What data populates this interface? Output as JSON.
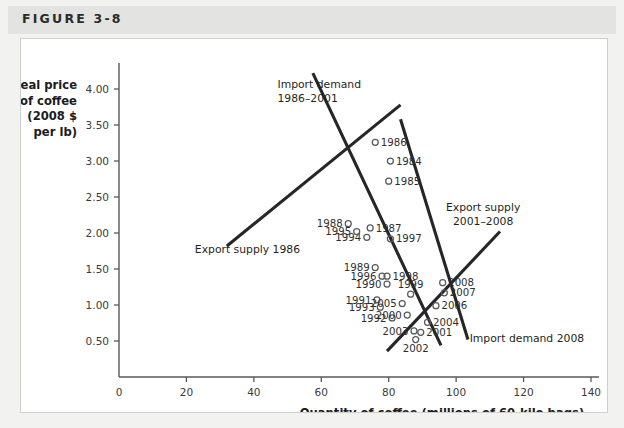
{
  "figure": {
    "label": "FIGURE 3-8"
  },
  "chart_data": {
    "type": "scatter",
    "title": "",
    "xlabel": "Quantity of coffee (millions of 60-kilo bags)",
    "ylabel_lines": [
      "Real price",
      "of coffee",
      "(2008 $",
      "per lb)"
    ],
    "xlim": [
      0,
      140
    ],
    "ylim": [
      0,
      4.25
    ],
    "xticks": [
      0,
      20,
      40,
      60,
      80,
      100,
      120,
      140
    ],
    "xtick_labels": [
      "0",
      "20",
      "40",
      "60",
      "80",
      "100",
      "120",
      "140"
    ],
    "yticks": [
      0.5,
      1.0,
      1.5,
      2.0,
      2.5,
      3.0,
      3.5,
      4.0
    ],
    "ytick_labels": [
      "0.50",
      "1.00",
      "1.50",
      "2.00",
      "2.50",
      "3.00",
      "3.50",
      "4.00"
    ],
    "grid": false,
    "legend": "none",
    "points": [
      {
        "year": "1984",
        "x": 80.5,
        "y": 3.0,
        "label_side": "right"
      },
      {
        "year": "1985",
        "x": 80.0,
        "y": 2.72,
        "label_side": "right"
      },
      {
        "year": "1986",
        "x": 76.0,
        "y": 3.26,
        "label_side": "right"
      },
      {
        "year": "1987",
        "x": 74.5,
        "y": 2.07,
        "label_side": "right"
      },
      {
        "year": "1988",
        "x": 68.0,
        "y": 2.13,
        "label_side": "left"
      },
      {
        "year": "1989",
        "x": 76.0,
        "y": 1.52,
        "label_side": "left"
      },
      {
        "year": "1990",
        "x": 79.5,
        "y": 1.29,
        "label_side": "left"
      },
      {
        "year": "1991",
        "x": 76.5,
        "y": 1.07,
        "label_side": "left"
      },
      {
        "year": "1992",
        "x": 81.0,
        "y": 0.82,
        "label_side": "left"
      },
      {
        "year": "1993",
        "x": 77.5,
        "y": 0.97,
        "label_side": "left"
      },
      {
        "year": "1994",
        "x": 73.5,
        "y": 1.94,
        "label_side": "left"
      },
      {
        "year": "1995",
        "x": 70.5,
        "y": 2.02,
        "label_side": "left"
      },
      {
        "year": "1996",
        "x": 78.0,
        "y": 1.4,
        "label_side": "left"
      },
      {
        "year": "1997",
        "x": 80.5,
        "y": 1.92,
        "label_side": "right"
      },
      {
        "year": "1998",
        "x": 79.5,
        "y": 1.4,
        "label_side": "right"
      },
      {
        "year": "1999",
        "x": 86.5,
        "y": 1.15,
        "label_side": "above"
      },
      {
        "year": "2000",
        "x": 85.5,
        "y": 0.86,
        "label_side": "left"
      },
      {
        "year": "2001",
        "x": 89.5,
        "y": 0.62,
        "label_side": "right"
      },
      {
        "year": "2002",
        "x": 88.0,
        "y": 0.52,
        "label_side": "below"
      },
      {
        "year": "2003",
        "x": 87.5,
        "y": 0.64,
        "label_side": "left"
      },
      {
        "year": "2004",
        "x": 91.5,
        "y": 0.76,
        "label_side": "right"
      },
      {
        "year": "2005",
        "x": 84.0,
        "y": 1.02,
        "label_side": "left"
      },
      {
        "year": "2006",
        "x": 94.0,
        "y": 0.99,
        "label_side": "right"
      },
      {
        "year": "2007",
        "x": 96.5,
        "y": 1.17,
        "label_side": "right"
      },
      {
        "year": "2008",
        "x": 96.0,
        "y": 1.31,
        "label_side": "right"
      }
    ],
    "curves": [
      {
        "name": "import-demand-1986-2001",
        "annotation": [
          "Import demand",
          "1986–2001"
        ],
        "x1": 57.5,
        "y1": 4.22,
        "x2": 95.5,
        "y2": 0.44
      },
      {
        "name": "export-supply-1986",
        "annotation": [
          "Export supply 1986"
        ],
        "x1": 32.0,
        "y1": 1.82,
        "x2": 83.5,
        "y2": 3.78
      },
      {
        "name": "export-supply-2001-2008",
        "annotation": [
          "Export supply",
          "2001–2008"
        ],
        "x1": 79.5,
        "y1": 0.36,
        "x2": 113.0,
        "y2": 2.02
      },
      {
        "name": "import-demand-2008",
        "annotation": [
          "Import demand 2008"
        ],
        "x1": 83.5,
        "y1": 3.58,
        "x2": 103.5,
        "y2": 0.52
      }
    ]
  }
}
